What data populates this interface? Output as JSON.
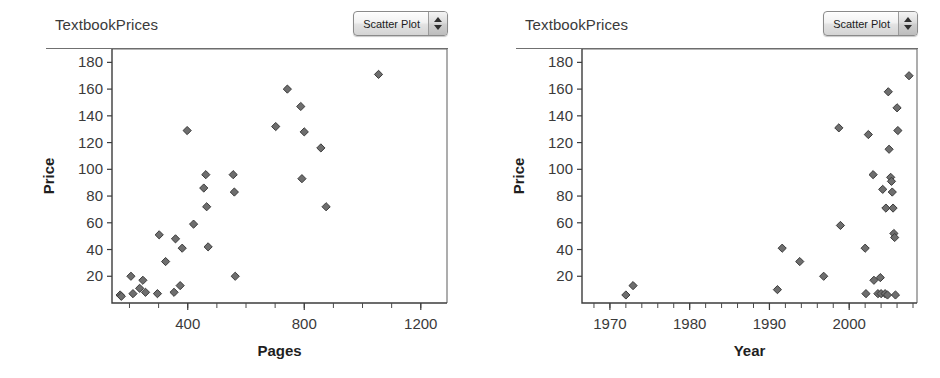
{
  "panels": [
    {
      "title": "TextbookPrices",
      "popup": {
        "label": "Scatter Plot",
        "stepper_up_icon": "triangle-up-icon",
        "stepper_down_icon": "triangle-down-icon"
      },
      "chart_data": {
        "type": "scatter",
        "title": "TextbookPrices",
        "xlabel": "Pages",
        "ylabel": "Price",
        "xlim": [
          140,
          1290
        ],
        "ylim": [
          0,
          190
        ],
        "xticks": [
          400,
          800,
          1200
        ],
        "xticklabels": [
          "400",
          "800",
          "1200"
        ],
        "xminor_step": 100,
        "yticks": [
          20,
          40,
          60,
          80,
          100,
          120,
          140,
          160,
          180
        ],
        "yticklabels": [
          "20",
          "40",
          "60",
          "80",
          "100",
          "120",
          "140",
          "160",
          "180"
        ],
        "grid": false,
        "legend": "none",
        "marker": "diamond",
        "marker_color": "#6e6e6e",
        "marker_edge_color": "#3b3b3b",
        "points": [
          [
            168,
            6
          ],
          [
            172,
            5
          ],
          [
            205,
            20
          ],
          [
            212,
            7
          ],
          [
            235,
            11
          ],
          [
            246,
            17
          ],
          [
            255,
            8
          ],
          [
            296,
            7
          ],
          [
            302,
            51
          ],
          [
            324,
            31
          ],
          [
            353,
            8
          ],
          [
            358,
            48
          ],
          [
            374,
            13
          ],
          [
            381,
            41
          ],
          [
            398,
            129
          ],
          [
            420,
            59
          ],
          [
            455,
            86
          ],
          [
            462,
            96
          ],
          [
            465,
            72
          ],
          [
            470,
            42
          ],
          [
            556,
            96
          ],
          [
            560,
            83
          ],
          [
            563,
            20
          ],
          [
            702,
            132
          ],
          [
            742,
            160
          ],
          [
            788,
            147
          ],
          [
            792,
            93
          ],
          [
            800,
            128
          ],
          [
            857,
            116
          ],
          [
            875,
            72
          ],
          [
            1055,
            171
          ]
        ]
      }
    },
    {
      "title": "TextbookPrices",
      "popup": {
        "label": "Scatter Plot",
        "stepper_up_icon": "triangle-up-icon",
        "stepper_down_icon": "triangle-down-icon"
      },
      "chart_data": {
        "type": "scatter",
        "title": "TextbookPrices",
        "xlabel": "Year",
        "ylabel": "Price",
        "xlim": [
          1966.5,
          2008.5
        ],
        "ylim": [
          0,
          190
        ],
        "xticks": [
          1970,
          1980,
          1990,
          2000
        ],
        "xticklabels": [
          "1970",
          "1980",
          "1990",
          "2000"
        ],
        "xminor_step": 2,
        "yticks": [
          20,
          40,
          60,
          80,
          100,
          120,
          140,
          160,
          180
        ],
        "yticklabels": [
          "20",
          "40",
          "60",
          "80",
          "100",
          "120",
          "140",
          "160",
          "180"
        ],
        "grid": false,
        "legend": "none",
        "marker": "diamond",
        "marker_color": "#6e6e6e",
        "marker_edge_color": "#3b3b3b",
        "points": [
          [
            1972.0,
            6
          ],
          [
            1972.9,
            13
          ],
          [
            1991.0,
            10
          ],
          [
            1991.6,
            41
          ],
          [
            1993.8,
            31
          ],
          [
            1996.8,
            20
          ],
          [
            1998.7,
            131
          ],
          [
            1998.9,
            58
          ],
          [
            2002.0,
            41
          ],
          [
            2002.1,
            7
          ],
          [
            2002.4,
            126
          ],
          [
            2003.0,
            96
          ],
          [
            2003.1,
            17
          ],
          [
            2003.6,
            7
          ],
          [
            2003.9,
            19
          ],
          [
            2004.0,
            7
          ],
          [
            2004.2,
            85
          ],
          [
            2004.5,
            7
          ],
          [
            2004.6,
            71
          ],
          [
            2004.8,
            6
          ],
          [
            2004.9,
            158
          ],
          [
            2005.0,
            115
          ],
          [
            2005.2,
            94
          ],
          [
            2005.3,
            91
          ],
          [
            2005.4,
            83
          ],
          [
            2005.5,
            71
          ],
          [
            2005.6,
            52
          ],
          [
            2005.7,
            49
          ],
          [
            2005.8,
            6
          ],
          [
            2006.0,
            146
          ],
          [
            2006.1,
            129
          ],
          [
            2007.5,
            170
          ]
        ]
      }
    }
  ]
}
